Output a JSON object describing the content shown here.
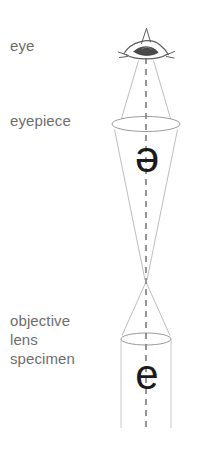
{
  "diagram": {
    "background_color": "#ffffff",
    "labels": {
      "eye": "eye",
      "eyepiece": "eyepiece",
      "objective": "objective",
      "lens": "lens",
      "specimen": "specimen"
    },
    "glyphs": {
      "virtual_image_letter": "e",
      "specimen_letter": "e",
      "virtual_image_orientation": "inverted-180-degrees",
      "specimen_orientation": "upright"
    },
    "colors": {
      "label_text": "#6e6e6e",
      "glyph_text": "#1b1b1b",
      "ray_line": "#b0b0b0",
      "lens_outline": "#8a8a8a",
      "axis_dash": "#7a7a7a",
      "eye_sketch": "#5a5a5a"
    },
    "optics": {
      "optical_axis_x": 146,
      "eye_center": {
        "x": 146,
        "y": 47
      },
      "eyepiece_lens": {
        "cx": 146,
        "cy": 124,
        "rx": 34,
        "ry": 7
      },
      "objective_lens": {
        "cx": 146,
        "cy": 339,
        "rx": 25,
        "ry": 6
      },
      "focal_crossover": {
        "x": 146,
        "y": 281
      },
      "tube_bottom_y": 428,
      "axis_dash_pattern": "6 5"
    }
  }
}
